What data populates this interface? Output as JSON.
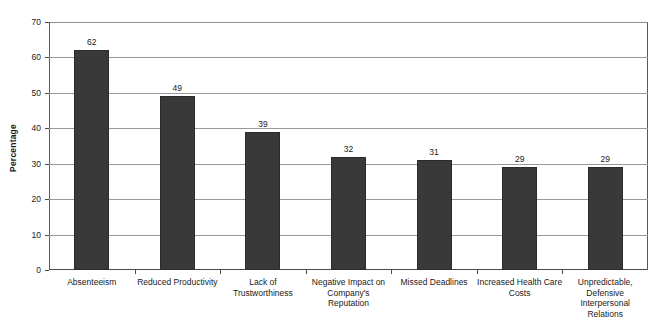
{
  "chart_data": {
    "type": "bar",
    "title": "",
    "xlabel": "",
    "ylabel": "Percentage",
    "ylim": [
      0,
      70
    ],
    "ytick_step": 10,
    "yticks": [
      0,
      10,
      20,
      30,
      40,
      50,
      60,
      70
    ],
    "grid": true,
    "legend": false,
    "bar_color": "#393939",
    "categories": [
      "Absenteeism",
      "Reduced Productivity",
      "Lack of\nTrustworthiness",
      "Negative Impact on\nCompany's\nReputation",
      "Missed Deadlines",
      "Increased Health Care\nCosts",
      "Unpredictable,\nDefensive\nInterpersonal\nRelations"
    ],
    "values": [
      62,
      49,
      39,
      32,
      31,
      29,
      29
    ],
    "value_labels": [
      "62",
      "49",
      "39",
      "32",
      "31",
      "29",
      "29"
    ]
  }
}
